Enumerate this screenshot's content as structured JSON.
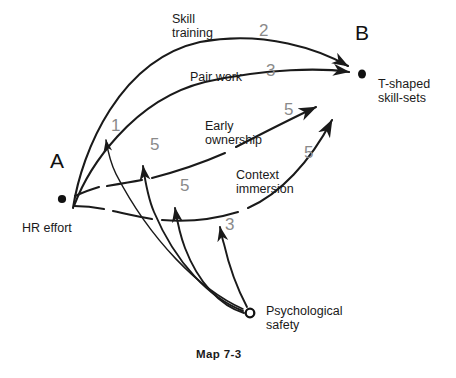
{
  "diagram": {
    "caption": "Map 7-3",
    "nodes": [
      {
        "id": "A",
        "letter": "A",
        "label": "HR effort",
        "kind": "filled-dot",
        "x": 62,
        "y": 199
      },
      {
        "id": "B",
        "letter": "B",
        "label": "T-shaped\nskill-sets",
        "kind": "filled-dot",
        "x": 362,
        "y": 74
      },
      {
        "id": "PS",
        "letter": "",
        "label": "Psychological\nsafety",
        "kind": "hollow-circle",
        "x": 250,
        "y": 313
      }
    ],
    "edges": [
      {
        "from": "A",
        "to": "B",
        "label": "Skill\ntraining",
        "weight": "2"
      },
      {
        "from": "A",
        "to": "B",
        "label": "Pair work",
        "weight": "3"
      },
      {
        "from": "A",
        "to": "B",
        "label": "Early\nownership",
        "weight": "5"
      },
      {
        "from": "A",
        "to": "B",
        "label": "Context\nimmersion",
        "weight": "5"
      },
      {
        "from": "PS",
        "to": "edge-skill-training",
        "label": "",
        "weight": "1"
      },
      {
        "from": "PS",
        "to": "edge-pair-work",
        "label": "",
        "weight": "5"
      },
      {
        "from": "PS",
        "to": "edge-early-ownership",
        "label": "",
        "weight": "5"
      },
      {
        "from": "PS",
        "to": "edge-context-immersion",
        "label": "",
        "weight": "3"
      }
    ],
    "labels": {
      "skill_training": "Skill\ntraining",
      "pair_work": "Pair work",
      "early_ownership": "Early\nownership",
      "context_immersion": "Context\nimmersion",
      "hr_effort": "HR effort",
      "t_shaped": "T-shaped\nskill-sets",
      "psychological_safety": "Psychological\nsafety",
      "node_a": "A",
      "node_b": "B"
    },
    "weights": {
      "skill_training": "2",
      "pair_work": "3",
      "early_ownership": "5",
      "context_immersion": "5",
      "ps_to_skill_training": "1",
      "ps_to_pair_work": "5",
      "ps_to_early_ownership": "5",
      "ps_to_context_immersion": "3"
    },
    "colors": {
      "stroke": "#1a1a1a",
      "text": "#1a1a1a",
      "weight": "#8a8a8a",
      "background": "#ffffff"
    }
  }
}
